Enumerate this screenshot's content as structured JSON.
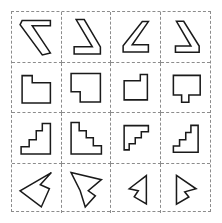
{
  "figure": {
    "title": "",
    "type": "shape-grid",
    "rows": 4,
    "columns": 4,
    "background_color": "#ffffff",
    "grid_line_color": "#8c8c8c",
    "grid_line_style": "dashed",
    "shape_stroke_color": "#1a1a1a",
    "shape_fill_color": "#ffffff"
  },
  "cells": [
    {
      "id": "cell-r1c1",
      "row": 1,
      "column": 1,
      "shape_name": "bent-arrow-seven-large",
      "stroke_width": 1.5,
      "viewbox": "0 0 48 48",
      "points": "10,8 38,8 38,13 20,13 38,40 30,42 8,12"
    },
    {
      "id": "cell-r1c2",
      "row": 1,
      "column": 2,
      "shape_name": "bent-arrow-seven-mirrored-large",
      "stroke_width": 1.5,
      "viewbox": "0 0 48 48",
      "points": "14,7 22,7 38,34 38,41 12,41 12,34 30,34"
    },
    {
      "id": "cell-r1c3",
      "row": 1,
      "column": 3,
      "shape_name": "bent-arrow-seven-rotated-small",
      "stroke_width": 1.5,
      "viewbox": "0 0 48 48",
      "points": "31,9 37,9 21,32 37,32 37,39 12,39 12,33"
    },
    {
      "id": "cell-r1c4",
      "row": 1,
      "column": 4,
      "shape_name": "bent-arrow-seven-mirrored-small",
      "stroke_width": 1.5,
      "viewbox": "0 0 48 48",
      "points": "15,9 22,9 37,33 37,39 14,39 14,33 29,33"
    },
    {
      "id": "cell-r2c1",
      "row": 2,
      "column": 1,
      "shape_name": "notched-rectangle-l-shape",
      "stroke_width": 1.5,
      "viewbox": "0 0 48 48",
      "points": "10,12 20,12 20,19 38,19 38,39 10,39"
    },
    {
      "id": "cell-r2c2",
      "row": 2,
      "column": 2,
      "shape_name": "notched-rectangle-flag-shape",
      "stroke_width": 1.5,
      "viewbox": "0 0 48 48",
      "points": "9,10 38,10 38,38 18,38 18,28 9,28"
    },
    {
      "id": "cell-r2c3",
      "row": 2,
      "column": 3,
      "shape_name": "notched-rectangle-small-step",
      "stroke_width": 1.5,
      "viewbox": "0 0 48 48",
      "points": "13,17 29,17 29,11 36,11 36,36 13,36"
    },
    {
      "id": "cell-r2c4",
      "row": 2,
      "column": 4,
      "shape_name": "notched-rectangle-tab-bottom",
      "stroke_width": 1.5,
      "viewbox": "0 0 48 48",
      "points": "12,12 38,12 38,31 27,31 27,38 20,38 20,31 12,31"
    },
    {
      "id": "cell-r3c1",
      "row": 3,
      "column": 1,
      "shape_name": "staircase-three-steps-right",
      "stroke_width": 1.5,
      "viewbox": "0 0 48 48",
      "points": "30,10 38,10 38,40 9,40 9,33 17,33 17,26 24,26 24,17 30,17"
    },
    {
      "id": "cell-r3c2",
      "row": 3,
      "column": 2,
      "shape_name": "staircase-four-steps-left",
      "stroke_width": 1.5,
      "viewbox": "0 0 48 48",
      "points": "9,9 17,9 17,17 24,17 24,24 31,24 31,32 39,32 39,40 9,40"
    },
    {
      "id": "cell-r3c3",
      "row": 3,
      "column": 3,
      "shape_name": "staircase-three-steps-small-left",
      "stroke_width": 1.5,
      "viewbox": "0 0 48 48",
      "points": "13,12 37,12 37,18 30,18 30,24 24,24 24,30 18,30 18,36 13,36"
    },
    {
      "id": "cell-r3c4",
      "row": 3,
      "column": 4,
      "shape_name": "staircase-three-steps-small-right",
      "stroke_width": 1.5,
      "viewbox": "0 0 48 48",
      "points": "29,12 36,12 36,38 12,38 12,32 18,32 18,26 24,26 24,19 29,19"
    },
    {
      "id": "cell-r4c1",
      "row": 4,
      "column": 1,
      "shape_name": "notched-triangle-arrow-left",
      "stroke_width": 1.5,
      "viewbox": "0 0 48 48",
      "points": "39,8 28,20 37,24 29,42 8,26"
    },
    {
      "id": "cell-r4c2",
      "row": 4,
      "column": 2,
      "shape_name": "notched-triangle-arrow-right",
      "stroke_width": 1.5,
      "viewbox": "0 0 48 48",
      "points": "9,8 39,15 26,26 33,31 23,42 18,26"
    },
    {
      "id": "cell-r4c3",
      "row": 4,
      "column": 3,
      "shape_name": "notched-triangle-arrow-left-small",
      "stroke_width": 1.5,
      "viewbox": "0 0 48 48",
      "points": "35,11 35,39 23,32 27,26 18,24 35,11"
    },
    {
      "id": "cell-r4c4",
      "row": 4,
      "column": 4,
      "shape_name": "notched-triangle-arrow-right-small",
      "stroke_width": 1.5,
      "viewbox": "0 0 48 48",
      "points": "15,11 34,24 23,27 27,32 15,39"
    }
  ]
}
